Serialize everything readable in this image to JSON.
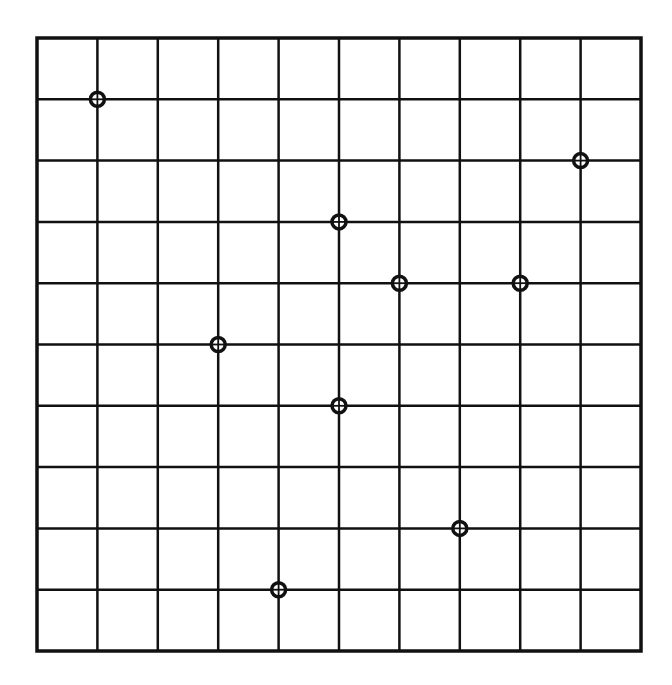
{
  "diagram": {
    "type": "grid-with-marked-points",
    "columns": 10,
    "rows": 10,
    "line_color": "#111111",
    "background": "#ffffff",
    "marker_style": "circle-with-crosshair",
    "points": [
      {
        "col": 1,
        "row": 1
      },
      {
        "col": 9,
        "row": 2
      },
      {
        "col": 5,
        "row": 3
      },
      {
        "col": 6,
        "row": 4
      },
      {
        "col": 8,
        "row": 4
      },
      {
        "col": 3,
        "row": 5
      },
      {
        "col": 5,
        "row": 6
      },
      {
        "col": 7,
        "row": 8
      },
      {
        "col": 4,
        "row": 9
      }
    ]
  }
}
